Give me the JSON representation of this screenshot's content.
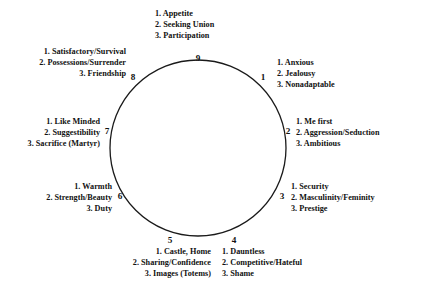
{
  "diagram": {
    "type": "enneagram-circle",
    "title": "",
    "circle": {
      "center_x": 198,
      "center_y": 148,
      "radius": 88,
      "stroke_color": "#1a1a1a",
      "stroke_width": 1.3,
      "fill": "none"
    },
    "positions": [
      {
        "number": "1",
        "num_x": 263,
        "num_y": 73,
        "text_x": 277,
        "text_y": 57,
        "align": "left",
        "traits": [
          "1. Anxious",
          "2. Jealousy",
          "3. Nonadaptable"
        ]
      },
      {
        "number": "2",
        "num_x": 288,
        "num_y": 127,
        "text_x": 296,
        "text_y": 116,
        "align": "left",
        "traits": [
          "1. Me first",
          "2. Aggression/Seduction",
          "3. Ambitious"
        ]
      },
      {
        "number": "3",
        "num_x": 282,
        "num_y": 192,
        "text_x": 291,
        "text_y": 181,
        "align": "left",
        "traits": [
          "1. Security",
          "2. Masculinity/Feminity",
          "3. Prestige"
        ]
      },
      {
        "number": "4",
        "num_x": 234,
        "num_y": 236,
        "text_x": 222,
        "text_y": 246,
        "align": "left",
        "traits": [
          "1. Dauntless",
          "2. Competitive/Hateful",
          "3. Shame"
        ]
      },
      {
        "number": "5",
        "num_x": 170,
        "num_y": 236,
        "text_x": 211,
        "text_y": 246,
        "align": "right",
        "traits": [
          "1. Castle, Home",
          "2. Sharing/Confidence",
          "3. Images (Totems)"
        ]
      },
      {
        "number": "6",
        "num_x": 120,
        "num_y": 192,
        "text_x": 112,
        "text_y": 181,
        "align": "right",
        "traits": [
          "1. Warmth",
          "2. Strength/Beauty",
          "3. Duty"
        ]
      },
      {
        "number": "7",
        "num_x": 107,
        "num_y": 127,
        "text_x": 100,
        "text_y": 116,
        "align": "right",
        "traits": [
          "1. Like Minded",
          "2. Suggestibility",
          "3. Sacrifice (Martyr)"
        ]
      },
      {
        "number": "8",
        "num_x": 133,
        "num_y": 73,
        "text_x": 126,
        "text_y": 46,
        "align": "right",
        "traits": [
          "1. Satisfactory/Survival",
          "2. Possessions/Surrender",
          "3. Friendship"
        ]
      },
      {
        "number": "9",
        "num_x": 198,
        "num_y": 54,
        "text_x": 155,
        "text_y": 8,
        "align": "left",
        "traits": [
          "1. Appetite",
          "2. Seeking Union",
          "3. Participation"
        ]
      }
    ]
  }
}
